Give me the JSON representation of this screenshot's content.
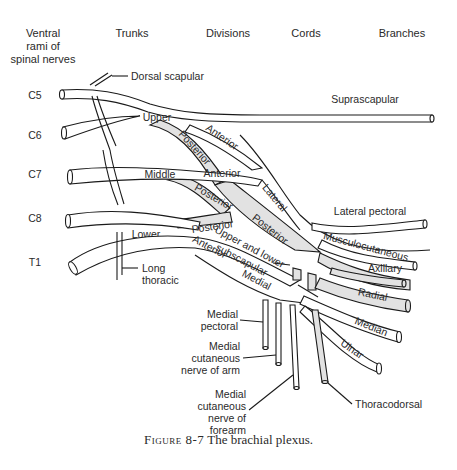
{
  "columns": {
    "ventral_rami": [
      "Ventral",
      "rami of",
      "spinal nerves"
    ],
    "trunks": "Trunks",
    "divisions": "Divisions",
    "cords": "Cords",
    "branches": "Branches"
  },
  "roots": [
    "C5",
    "C6",
    "C7",
    "C8",
    "T1"
  ],
  "trunks": {
    "upper": "Upper",
    "middle": "Middle",
    "lower": "Lower"
  },
  "divisions": {
    "anterior": "Anterior",
    "posterior": "Posterior"
  },
  "cords": {
    "lateral": "Lateral",
    "posterior": "Posterior",
    "medial": "Medial"
  },
  "branches": {
    "dorsal_scapular": "Dorsal scapular",
    "suprascapular": "Suprascapular",
    "lateral_pectoral": "Lateral pectoral",
    "musculocutaneous": "Musculocutaneous",
    "axillary": "Axillary",
    "radial": "Radial",
    "median": "Median",
    "ulnar": "Ulnar",
    "long_thoracic": [
      "Long",
      "thoracic"
    ],
    "upper_lower_subscapular": [
      "Upper and lower",
      "subscapular"
    ],
    "medial_pectoral": [
      "Medial",
      "pectoral"
    ],
    "medial_cutaneous_arm": [
      "Medial",
      "cutaneous",
      "nerve of arm"
    ],
    "medial_cutaneous_forearm": [
      "Medial",
      "cutaneous",
      "nerve of",
      "forearm"
    ],
    "thoracodorsal": "Thoracodorsal"
  },
  "caption": {
    "figure": "Figure 8-7",
    "text": "The brachial plexus."
  },
  "colors": {
    "line": "#1a1a1a",
    "posterior_fill": "#e2e2e2",
    "background": "#ffffff"
  }
}
